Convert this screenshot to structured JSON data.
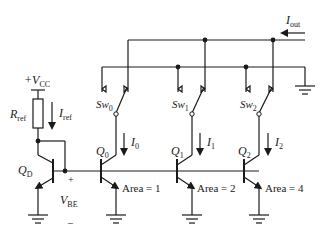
{
  "diagram": {
    "type": "circuit",
    "supply": {
      "label": "+V",
      "sub": "CC"
    },
    "resistor": {
      "label": "R",
      "sub": "ref"
    },
    "ref_current": {
      "label": "I",
      "sub": "ref"
    },
    "diode_transistor": {
      "label": "Q",
      "sub": "D"
    },
    "vbe": {
      "label": "V",
      "sub": "BE",
      "plus": "+",
      "minus": "–"
    },
    "output_current": {
      "label": "I",
      "sub": "out"
    },
    "branches": [
      {
        "transistor": "Q",
        "t_sub": "0",
        "current": "I",
        "c_sub": "0",
        "switch": "Sw",
        "s_sub": "0",
        "area": "Area = 1"
      },
      {
        "transistor": "Q",
        "t_sub": "1",
        "current": "I",
        "c_sub": "1",
        "switch": "Sw",
        "s_sub": "1",
        "area": "Area = 2"
      },
      {
        "transistor": "Q",
        "t_sub": "2",
        "current": "I",
        "c_sub": "2",
        "switch": "Sw",
        "s_sub": "2",
        "area": "Area = 4"
      }
    ]
  }
}
